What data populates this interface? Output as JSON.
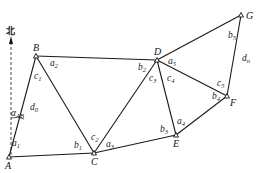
{
  "diagram": {
    "north_label": "北",
    "azimuth_label": {
      "main": "α",
      "sub": "AB"
    },
    "points": [
      {
        "id": "A",
        "x": 9,
        "y": 157,
        "label": "A"
      },
      {
        "id": "B",
        "x": 36,
        "y": 56,
        "label": "B"
      },
      {
        "id": "C",
        "x": 94,
        "y": 153,
        "label": "C"
      },
      {
        "id": "D",
        "x": 157,
        "y": 60,
        "label": "D"
      },
      {
        "id": "E",
        "x": 176,
        "y": 135,
        "label": "E"
      },
      {
        "id": "F",
        "x": 227,
        "y": 96,
        "label": "F"
      },
      {
        "id": "G",
        "x": 241,
        "y": 15,
        "label": "G"
      }
    ],
    "edges": [
      [
        "A",
        "B"
      ],
      [
        "A",
        "C"
      ],
      [
        "B",
        "C"
      ],
      [
        "B",
        "D"
      ],
      [
        "C",
        "D"
      ],
      [
        "C",
        "E"
      ],
      [
        "D",
        "E"
      ],
      [
        "D",
        "F"
      ],
      [
        "D",
        "G"
      ],
      [
        "E",
        "F"
      ],
      [
        "F",
        "G"
      ]
    ],
    "angle_labels": [
      {
        "main": "a",
        "sub": "1",
        "x": 12,
        "y": 146
      },
      {
        "main": "b",
        "sub": "1",
        "x": 74,
        "y": 148
      },
      {
        "main": "c",
        "sub": "1",
        "x": 34,
        "y": 79
      },
      {
        "main": "d",
        "sub": "0",
        "x": 30,
        "y": 110
      },
      {
        "main": "a",
        "sub": "2",
        "x": 50,
        "y": 66
      },
      {
        "main": "c",
        "sub": "2",
        "x": 91,
        "y": 140
      },
      {
        "main": "a",
        "sub": "3",
        "x": 106,
        "y": 147
      },
      {
        "main": "b",
        "sub": "2",
        "x": 138,
        "y": 70
      },
      {
        "main": "c",
        "sub": "3",
        "x": 149,
        "y": 81
      },
      {
        "main": "c",
        "sub": "4",
        "x": 167,
        "y": 81
      },
      {
        "main": "a",
        "sub": "5",
        "x": 168,
        "y": 64
      },
      {
        "main": "b",
        "sub": "3",
        "x": 160,
        "y": 132
      },
      {
        "main": "a",
        "sub": "4",
        "x": 177,
        "y": 124
      },
      {
        "main": "c",
        "sub": "5",
        "x": 217,
        "y": 86
      },
      {
        "main": "b",
        "sub": "4",
        "x": 212,
        "y": 99
      },
      {
        "main": "b",
        "sub": "5",
        "x": 228,
        "y": 38
      },
      {
        "main": "d",
        "sub": "n",
        "x": 242,
        "y": 61
      }
    ]
  }
}
